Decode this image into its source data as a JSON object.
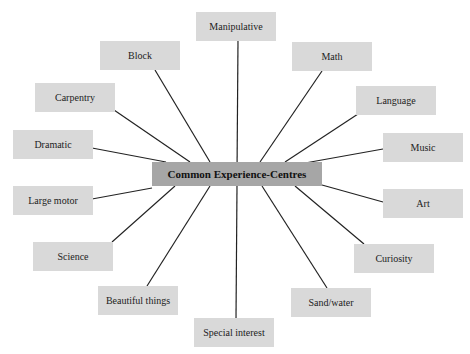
{
  "diagram": {
    "type": "hub-and-spoke",
    "center": {
      "label": "Common Experience-Centres"
    },
    "nodes": [
      {
        "label": "Manipulative"
      },
      {
        "label": "Block"
      },
      {
        "label": "Math"
      },
      {
        "label": "Carpentry"
      },
      {
        "label": "Language"
      },
      {
        "label": "Dramatic"
      },
      {
        "label": "Music"
      },
      {
        "label": "Large motor"
      },
      {
        "label": "Art"
      },
      {
        "label": "Science"
      },
      {
        "label": "Curiosity"
      },
      {
        "label": "Beautiful things"
      },
      {
        "label": "Sand/water"
      },
      {
        "label": "Special interest"
      }
    ],
    "colors": {
      "node_fill": "#d9d9d9",
      "center_fill": "#a6a6a6",
      "line": "#222222"
    }
  }
}
